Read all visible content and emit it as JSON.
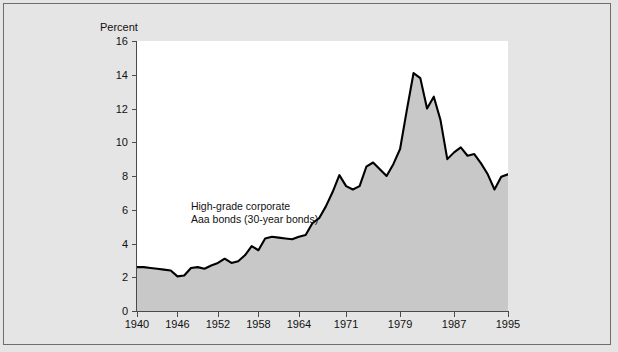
{
  "chart_data": {
    "type": "area",
    "title": "",
    "subtitle": "",
    "xlabel": "",
    "ylabel": "Percent",
    "ylim": [
      0,
      16
    ],
    "xlim": [
      1940,
      1995
    ],
    "grid": false,
    "legend_position": "inside-left",
    "yticks": [
      0,
      2,
      4,
      6,
      8,
      10,
      12,
      14,
      16
    ],
    "ytick_labels": [
      "0",
      "2",
      "4",
      "6",
      "8",
      "10",
      "12",
      "14",
      "16"
    ],
    "xticks": [
      1940,
      1946,
      1952,
      1958,
      1964,
      1971,
      1979,
      1987,
      1995
    ],
    "xtick_labels": [
      "1940",
      "1946",
      "1952",
      "1958",
      "1964",
      "1971",
      "1979",
      "1987",
      "1995"
    ],
    "annotations": [
      {
        "text_line_1": "High-grade corporate",
        "text_line_2": "Aaa bonds (30-year bonds)",
        "x": 1948,
        "y": 6.6
      }
    ],
    "series": [
      {
        "name": "High-grade corporate Aaa bonds (30-year bonds)",
        "line_color": "#000000",
        "fill_color": "#c8c8c8",
        "x": [
          1940,
          1941,
          1942,
          1943,
          1944,
          1945,
          1946,
          1947,
          1948,
          1949,
          1950,
          1951,
          1952,
          1953,
          1954,
          1955,
          1956,
          1957,
          1958,
          1959,
          1960,
          1961,
          1962,
          1963,
          1964,
          1965,
          1966,
          1967,
          1968,
          1969,
          1970,
          1971,
          1972,
          1973,
          1974,
          1975,
          1976,
          1977,
          1978,
          1979,
          1980,
          1981,
          1982,
          1983,
          1984,
          1985,
          1986,
          1987,
          1988,
          1989,
          1990,
          1991,
          1992,
          1993,
          1994,
          1995
        ],
        "values": [
          2.6,
          2.6,
          2.55,
          2.5,
          2.45,
          2.4,
          2.05,
          2.1,
          2.55,
          2.6,
          2.5,
          2.7,
          2.85,
          3.1,
          2.85,
          2.95,
          3.3,
          3.85,
          3.6,
          4.3,
          4.4,
          4.35,
          4.3,
          4.25,
          4.4,
          4.5,
          5.2,
          5.5,
          6.2,
          7.05,
          8.05,
          7.4,
          7.2,
          7.4,
          8.55,
          8.8,
          8.4,
          8.0,
          8.7,
          9.6,
          11.9,
          14.1,
          13.8,
          12.0,
          12.7,
          11.3,
          9.0,
          9.4,
          9.7,
          9.2,
          9.3,
          8.75,
          8.1,
          7.2,
          7.95,
          8.1
        ]
      }
    ]
  }
}
